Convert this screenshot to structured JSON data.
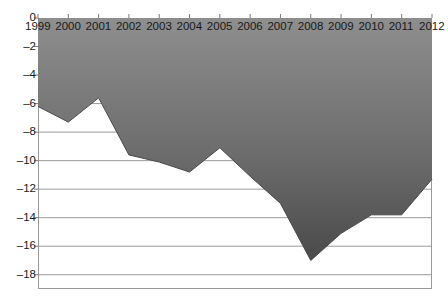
{
  "chart_data": {
    "type": "area",
    "title": "",
    "subtitle": "",
    "xlabel": "",
    "ylabel": "",
    "categories": [
      "1999",
      "2000",
      "2001",
      "2002",
      "2003",
      "2004",
      "2005",
      "2006",
      "2007",
      "2008",
      "2009",
      "2010",
      "2011",
      "2012"
    ],
    "x": [
      1999,
      2000,
      2001,
      2002,
      2003,
      2004,
      2005,
      2006,
      2007,
      2008,
      2009,
      2010,
      2011,
      2012
    ],
    "values": [
      -6.2,
      -7.3,
      -5.6,
      -9.6,
      -10.1,
      -10.8,
      -9.1,
      -11.1,
      -13.0,
      -17.0,
      -15.1,
      -13.8,
      -13.8,
      -11.3
    ],
    "series": [
      {
        "name": "",
        "values": [
          -6.2,
          -7.3,
          -5.6,
          -9.6,
          -10.1,
          -10.8,
          -9.1,
          -11.1,
          -13.0,
          -17.0,
          -15.1,
          -13.8,
          -13.8,
          -11.3
        ]
      }
    ],
    "ylim": [
      -19,
      0
    ],
    "xlim": [
      1999,
      2012
    ],
    "yticks": [
      0,
      -2,
      -4,
      -6,
      -8,
      -10,
      -12,
      -14,
      -16,
      -18
    ],
    "ytick_labels": [
      "0",
      "–2",
      "–4",
      "–6",
      "–8",
      "–10",
      "–12",
      "–14",
      "–16",
      "–18"
    ],
    "xticks": [
      1999,
      2000,
      2001,
      2002,
      2003,
      2004,
      2005,
      2006,
      2007,
      2008,
      2009,
      2010,
      2011,
      2012
    ],
    "xtick_labels": [
      "1999",
      "2000",
      "2001",
      "2002",
      "2003",
      "2004",
      "2005",
      "2006",
      "2007",
      "2008",
      "2009",
      "2010",
      "2011",
      "2012"
    ],
    "grid": true,
    "grid_axis": "y",
    "legend": null,
    "legend_position": "none",
    "annotations": [],
    "colors": {
      "fill_top": "#8c8c8c",
      "fill_bottom": "#4e4e4e",
      "line": "#4a4a4a",
      "grid": "#8f8f8f",
      "axis": "#7a7a7a",
      "text": "#1a1a1a",
      "background": "#ffffff"
    }
  }
}
